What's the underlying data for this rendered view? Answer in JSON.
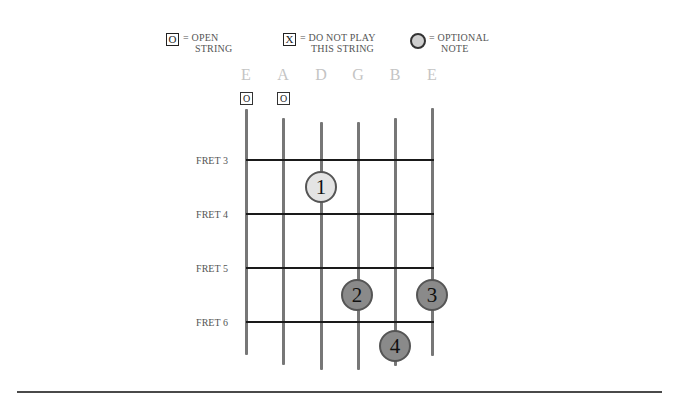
{
  "legend": {
    "open": {
      "symbol": "O",
      "line1": "= OPEN",
      "line2": "STRING"
    },
    "muted": {
      "symbol": "X",
      "line1": "= DO NOT PLAY",
      "line2": "THIS STRING"
    },
    "optional": {
      "line1": "= OPTIONAL",
      "line2": "NOTE"
    }
  },
  "strings": [
    {
      "name": "E",
      "open": "O"
    },
    {
      "name": "A",
      "open": "O"
    },
    {
      "name": "D",
      "open": null
    },
    {
      "name": "G",
      "open": null
    },
    {
      "name": "B",
      "open": null
    },
    {
      "name": "E",
      "open": null
    }
  ],
  "frets": [
    {
      "label": "FRET 3"
    },
    {
      "label": "FRET 4"
    },
    {
      "label": "FRET 5"
    },
    {
      "label": "FRET 6"
    }
  ],
  "fingers": [
    {
      "number": "1",
      "string": "D",
      "between_frets": "3-4",
      "type": "optional"
    },
    {
      "number": "2",
      "string": "G",
      "between_frets": "5-6",
      "type": "pressed"
    },
    {
      "number": "3",
      "string": "E (high)",
      "between_frets": "5-6",
      "type": "pressed"
    },
    {
      "number": "4",
      "string": "B",
      "between_frets": "below 6",
      "type": "pressed"
    }
  ],
  "colors": {
    "pressed_fill": "#8a8a8a",
    "optional_fill": "#e4e4e4",
    "string_color": "#777777",
    "fret_color": "#1a1a1a",
    "string_name_color": "#c4c4c4"
  }
}
